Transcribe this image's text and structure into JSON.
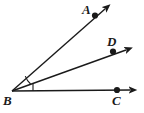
{
  "figure": {
    "type": "geometry-diagram",
    "background_color": "#ffffff",
    "stroke_color": "#1a1a1a",
    "vertex_label": "B"
  },
  "labels": {
    "a": "A",
    "b": "B",
    "c": "C",
    "d": "D"
  },
  "points": [
    {
      "name": "B",
      "label": "B",
      "x": 12,
      "y": 91,
      "role": "vertex",
      "dot": false
    },
    {
      "name": "A",
      "label": "A",
      "x": 95,
      "y": 15,
      "role": "ray-point",
      "dot": true
    },
    {
      "name": "D",
      "label": "D",
      "x": 113,
      "y": 51,
      "role": "ray-point",
      "dot": true
    },
    {
      "name": "C",
      "label": "C",
      "x": 117,
      "y": 90,
      "role": "ray-point",
      "dot": true
    }
  ],
  "rays": [
    {
      "name": "ray-BA",
      "from": "B",
      "through": "A",
      "tip_x": 110,
      "tip_y": 5,
      "arrow": true
    },
    {
      "name": "ray-BD",
      "from": "B",
      "through": "D",
      "tip_x": 132,
      "tip_y": 48,
      "arrow": true
    },
    {
      "name": "ray-BC",
      "from": "B",
      "through": "C",
      "tip_x": 136,
      "tip_y": 90,
      "arrow": true
    }
  ],
  "angle_marks": [
    {
      "name": "angle-ABD-arc",
      "between": [
        "ray-BA",
        "ray-BD"
      ],
      "style": "arc",
      "radius": 20
    },
    {
      "name": "angle-DBC-tick",
      "between": [
        "ray-BD",
        "ray-BC"
      ],
      "style": "tick",
      "x": 33,
      "y_top": 83,
      "y_bottom": 91
    }
  ],
  "colors": {
    "stroke": "#1a1a1a",
    "label": "#1a1a1a",
    "background": "#ffffff"
  }
}
